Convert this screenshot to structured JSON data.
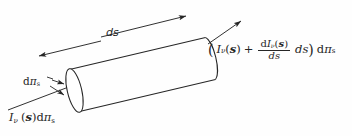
{
  "figure": {
    "background_color": "#fefefe",
    "line_color": "#262626",
    "width": 352,
    "height": 136
  },
  "labels": {
    "length": {
      "text": "ds",
      "role": "path-length-dimension"
    },
    "cross_section": {
      "d": "d",
      "pi": "π",
      "sub": "s",
      "role": "differential-cross-sectional-area"
    },
    "incoming": {
      "I": "I",
      "nu": "ν",
      "open": "(",
      "vector": "s",
      "close": ")",
      "d": "d",
      "pi": "π",
      "sub": "s",
      "role": "incident-specific-intensity-times-area"
    },
    "outgoing": {
      "open_paren": "(",
      "I": "I",
      "nu": "ν",
      "arg_open": "(",
      "vector": "s",
      "arg_close": ")",
      "plus": "+",
      "numerator_d": "d",
      "numerator_I": "I",
      "numerator_nu": "ν",
      "numerator_open": "(",
      "numerator_vector": "s",
      "numerator_close": ")",
      "denominator": "ds",
      "ds": "ds",
      "close_paren": ")",
      "d": "d",
      "pi": "π",
      "sub": "s",
      "role": "emergent-specific-intensity-times-area"
    }
  }
}
